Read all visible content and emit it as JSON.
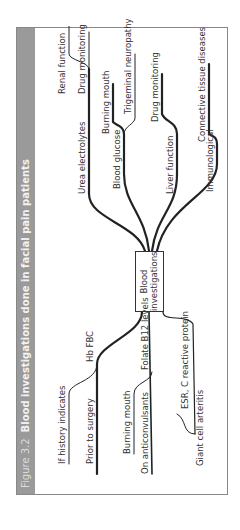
{
  "figure": {
    "number": "Figure 3.2",
    "title": "Blood investigations done in facial pain patients",
    "center": {
      "line1": "Blood",
      "line2": "investigations"
    },
    "branches": [
      {
        "label": "Hb FBC",
        "children": [
          "If history indicates",
          "Prior to surgery"
        ]
      },
      {
        "label": "Folate B12 levels",
        "children": [
          "Burning mouth",
          "On anticonvulsants"
        ]
      },
      {
        "label": "ESR, C reactive protein",
        "children": [
          "Giant cell arteritis"
        ]
      },
      {
        "label": "Urea electrolytes",
        "children": [
          "Renal function",
          "Drug monitoring"
        ]
      },
      {
        "label": "Blood glucose",
        "children": [
          "Burning mouth",
          "Trigeminal neuropathy"
        ]
      },
      {
        "label": "Liver function",
        "children": [
          "Drug monitoring"
        ]
      },
      {
        "label": "Immunological",
        "children": [
          "Connective tissue diseases"
        ]
      }
    ]
  },
  "colors": {
    "header_bg": "#9a9a9a",
    "line": "#222222",
    "border": "#888888"
  }
}
